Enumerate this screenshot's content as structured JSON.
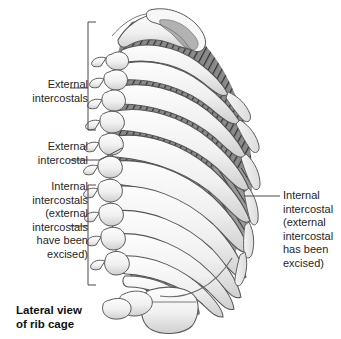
{
  "figure": {
    "title": "Lateral view of rib cage",
    "caption": "Lateral view\nof rib cage",
    "background_color": "#ffffff",
    "line_color": "#4a4a4a",
    "text_color": "#262626"
  },
  "labels": [
    {
      "id": "external-intercostals",
      "text": "External\nintercostals",
      "align": "right",
      "x": 8,
      "y": 78,
      "width": 80
    },
    {
      "id": "external-intercostal",
      "text": "External\nintercostal",
      "align": "right",
      "x": 8,
      "y": 140,
      "width": 80
    },
    {
      "id": "internal-intercostals-excised",
      "text": "Internal\nintercostals\n(external\nintercostals\nhave been\nexcised)",
      "align": "right",
      "x": 4,
      "y": 180,
      "width": 84
    },
    {
      "id": "internal-intercostal-excised",
      "text": "Internal\nintercostal\n(external\nintercostal\nhas been\nexcised)",
      "align": "left",
      "x": 283,
      "y": 189,
      "width": 58
    }
  ],
  "anatomy": {
    "structures": [
      "clavicle",
      "scapula",
      "rib-1",
      "ribs",
      "costal-cartilage",
      "thoracic-vertebrae",
      "external-intercostal-muscles",
      "internal-intercostal-muscles"
    ],
    "rib_count": 11,
    "vertebra_count": 9,
    "bone_fill": "#f2f2f2",
    "bone_stroke": "#5a5a5a",
    "muscle_dark": "#3c3c3c",
    "muscle_mid": "#7d7d7d",
    "muscle_light": "#b9b9b9"
  },
  "caption_pos": {
    "x": 16,
    "y": 303
  }
}
